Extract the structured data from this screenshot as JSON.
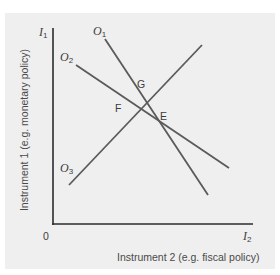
{
  "diagram": {
    "y_axis": {
      "symbol": "I",
      "subscript": "1",
      "title": "Instrument 1 (e.g. monetary policy)"
    },
    "x_axis": {
      "symbol": "I",
      "subscript": "2",
      "title": "Instrument 2 (e.g. fiscal policy)"
    },
    "origin": "0",
    "lines": [
      {
        "symbol": "O",
        "subscript": "1"
      },
      {
        "symbol": "O",
        "subscript": "2"
      },
      {
        "symbol": "O",
        "subscript": "3"
      }
    ],
    "points": [
      {
        "label": "G"
      },
      {
        "label": "F"
      },
      {
        "label": "E"
      }
    ],
    "colors": {
      "background": "#efefef",
      "axis": "#2b2b2b",
      "line": "#5a5a5a",
      "text": "#3c3c3c"
    }
  }
}
